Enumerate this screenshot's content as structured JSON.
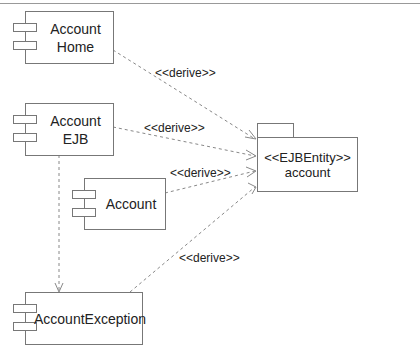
{
  "diagram": {
    "type": "UML component diagram",
    "components": [
      {
        "id": "account-home",
        "label_lines": [
          "Account",
          "Home"
        ]
      },
      {
        "id": "account-ejb",
        "label_lines": [
          "Account",
          "EJB"
        ]
      },
      {
        "id": "account",
        "label_lines": [
          "Account"
        ]
      },
      {
        "id": "account-exception",
        "label_lines": [
          "AccountException"
        ]
      }
    ],
    "package": {
      "id": "account-package",
      "stereotype": "<<EJBEntity>>",
      "name": "account"
    },
    "dependencies": [
      {
        "from": "account-home",
        "to": "account-package",
        "label": "<<derive>>"
      },
      {
        "from": "account-ejb",
        "to": "account-package",
        "label": "<<derive>>"
      },
      {
        "from": "account",
        "to": "account-package",
        "label": "<<derive>>"
      },
      {
        "from": "account-exception",
        "to": "account-package",
        "label": "<<derive>>"
      },
      {
        "from": "account-ejb",
        "to": "account-exception",
        "label": ""
      }
    ]
  }
}
